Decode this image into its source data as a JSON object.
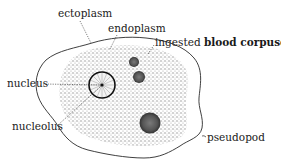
{
  "diagram": {
    "labels": {
      "ectoplasm": "ectoplasm",
      "endoplasm": "endoplasm",
      "ingested_prefix": "ingested",
      "ingested_rest": "blood corpuscle",
      "nucleus": "nucleus",
      "nucleolus": "nucleolus",
      "pseudopod": "pseudopod"
    },
    "colors": {
      "outline": "#2a2a2a",
      "stipple": "#9a9a9a",
      "corpuscle": "#555555",
      "background": "#ffffff"
    }
  }
}
